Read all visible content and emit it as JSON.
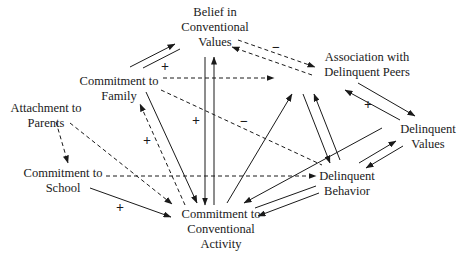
{
  "diagram": {
    "type": "path-model",
    "nodes": [
      {
        "id": "belief",
        "lines": [
          "Belief in",
          "Conventional",
          "Values"
        ],
        "x": 215,
        "y": 5
      },
      {
        "id": "assoc",
        "lines": [
          "Association with",
          "Delinquent Peers"
        ],
        "x": 367,
        "y": 50
      },
      {
        "id": "family",
        "lines": [
          "Commitment to",
          "Family"
        ],
        "x": 119,
        "y": 74
      },
      {
        "id": "parents",
        "lines": [
          "Attachment to",
          "Parents"
        ],
        "x": 46,
        "y": 101
      },
      {
        "id": "dvalues",
        "lines": [
          "Delinquent",
          "Values"
        ],
        "x": 428,
        "y": 122
      },
      {
        "id": "school",
        "lines": [
          "Commitment to",
          "School"
        ],
        "x": 63,
        "y": 166
      },
      {
        "id": "dbehavior",
        "lines": [
          "Delinquent",
          "Behavior"
        ],
        "x": 347,
        "y": 169
      },
      {
        "id": "activity",
        "lines": [
          "Commitment to",
          "Conventional",
          "Activity"
        ],
        "x": 221,
        "y": 207
      }
    ],
    "signs": [
      {
        "label": "+",
        "x": 165,
        "y": 67
      },
      {
        "label": "−",
        "x": 276,
        "y": 48
      },
      {
        "label": "+",
        "x": 196,
        "y": 121
      },
      {
        "label": "−",
        "x": 244,
        "y": 122
      },
      {
        "label": "+",
        "x": 147,
        "y": 141
      },
      {
        "label": "+",
        "x": 368,
        "y": 105
      },
      {
        "label": "+",
        "x": 120,
        "y": 208
      }
    ],
    "edges": [
      {
        "from": "family",
        "to": "belief",
        "x1": 130,
        "y1": 67,
        "x2": 175,
        "y2": 44,
        "style": "solid",
        "arrow": true
      },
      {
        "from": "belief",
        "to": "family",
        "x1": 180,
        "y1": 49,
        "x2": 143,
        "y2": 68,
        "style": "solid",
        "arrow": false
      },
      {
        "from": "belief",
        "to": "assoc",
        "x1": 238,
        "y1": 40,
        "x2": 315,
        "y2": 67,
        "style": "dashed",
        "arrow": true
      },
      {
        "from": "assoc",
        "to": "belief",
        "x1": 312,
        "y1": 75,
        "x2": 232,
        "y2": 47,
        "style": "dashed",
        "arrow": true
      },
      {
        "from": "family",
        "to": "assoc",
        "x1": 163,
        "y1": 78,
        "x2": 274,
        "y2": 78,
        "style": "dashed",
        "arrow": true
      },
      {
        "from": "belief",
        "to": "activity",
        "x1": 205,
        "y1": 57,
        "x2": 205,
        "y2": 205,
        "style": "solid",
        "arrow": true
      },
      {
        "from": "activity",
        "to": "belief",
        "x1": 214,
        "y1": 205,
        "x2": 214,
        "y2": 57,
        "style": "solid",
        "arrow": true
      },
      {
        "from": "family",
        "to": "dbehavior",
        "x1": 161,
        "y1": 90,
        "x2": 322,
        "y2": 165,
        "style": "dashed",
        "arrow": false
      },
      {
        "from": "family",
        "to": "activity",
        "x1": 146,
        "y1": 92,
        "x2": 197,
        "y2": 203,
        "style": "solid",
        "arrow": true
      },
      {
        "from": "activity",
        "to": "family",
        "x1": 185,
        "y1": 205,
        "x2": 140,
        "y2": 104,
        "style": "dashed",
        "arrow": true
      },
      {
        "from": "activity",
        "to": "assoc",
        "x1": 227,
        "y1": 203,
        "x2": 292,
        "y2": 94,
        "style": "solid",
        "arrow": true
      },
      {
        "from": "assoc",
        "to": "dbehavior",
        "x1": 303,
        "y1": 94,
        "x2": 330,
        "y2": 163,
        "style": "solid",
        "arrow": true
      },
      {
        "from": "dbehavior",
        "to": "assoc",
        "x1": 340,
        "y1": 160,
        "x2": 314,
        "y2": 94,
        "style": "solid",
        "arrow": true
      },
      {
        "from": "assoc",
        "to": "dvalues",
        "x1": 358,
        "y1": 83,
        "x2": 415,
        "y2": 116,
        "style": "solid",
        "arrow": true
      },
      {
        "from": "dvalues",
        "to": "assoc",
        "x1": 400,
        "y1": 120,
        "x2": 345,
        "y2": 90,
        "style": "solid",
        "arrow": true
      },
      {
        "from": "dvalues",
        "to": "activity",
        "x1": 382,
        "y1": 128,
        "x2": 244,
        "y2": 203,
        "style": "solid",
        "arrow": true
      },
      {
        "from": "dbehavior",
        "to": "dvalues",
        "x1": 359,
        "y1": 163,
        "x2": 396,
        "y2": 141,
        "style": "solid",
        "arrow": true
      },
      {
        "from": "dvalues",
        "to": "dbehavior",
        "x1": 403,
        "y1": 146,
        "x2": 366,
        "y2": 168,
        "style": "solid",
        "arrow": true
      },
      {
        "from": "dbehavior",
        "to": "activity",
        "x1": 316,
        "y1": 186,
        "x2": 255,
        "y2": 208,
        "style": "solid",
        "arrow": false
      },
      {
        "from": "dbehavior",
        "to": "activity",
        "x1": 319,
        "y1": 193,
        "x2": 258,
        "y2": 216,
        "style": "solid",
        "arrow": true
      },
      {
        "from": "school",
        "to": "dbehavior",
        "x1": 106,
        "y1": 176,
        "x2": 316,
        "y2": 176,
        "style": "dashed",
        "arrow": true
      },
      {
        "from": "parents",
        "to": "school",
        "x1": 56,
        "y1": 122,
        "x2": 68,
        "y2": 163,
        "style": "dashed",
        "arrow": true
      },
      {
        "from": "parents",
        "to": "activity",
        "x1": 70,
        "y1": 123,
        "x2": 172,
        "y2": 204,
        "style": "dashed",
        "arrow": true
      },
      {
        "from": "school",
        "to": "activity",
        "x1": 90,
        "y1": 188,
        "x2": 171,
        "y2": 217,
        "style": "solid",
        "arrow": true
      }
    ]
  }
}
